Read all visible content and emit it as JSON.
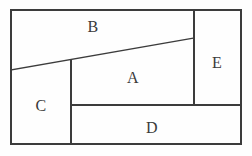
{
  "figure": {
    "type": "rectangle-dissection",
    "title": "",
    "background_color": "#fefefe",
    "line_color": "#3c3c3c",
    "label_color": "#3a3a3a",
    "canvas": {
      "width": 252,
      "height": 156
    },
    "outer_border": {
      "x1": 11,
      "y1": 10,
      "x2": 241,
      "y2": 144
    },
    "regions": [
      {
        "id": "A",
        "label": "A",
        "label_x": 133,
        "label_y": 78
      },
      {
        "id": "B",
        "label": "B",
        "label_x": 93,
        "label_y": 27
      },
      {
        "id": "C",
        "label": "C",
        "label_x": 41,
        "label_y": 106
      },
      {
        "id": "D",
        "label": "D",
        "label_x": 152,
        "label_y": 128
      },
      {
        "id": "E",
        "label": "E",
        "label_x": 217,
        "label_y": 63
      }
    ],
    "segments": [
      {
        "name": "outer-top",
        "x1": 11,
        "y1": 10,
        "x2": 241,
        "y2": 10
      },
      {
        "name": "outer-right",
        "x1": 241,
        "y1": 10,
        "x2": 241,
        "y2": 144
      },
      {
        "name": "outer-bottom",
        "x1": 241,
        "y1": 144,
        "x2": 11,
        "y2": 144
      },
      {
        "name": "outer-left",
        "x1": 11,
        "y1": 144,
        "x2": 11,
        "y2": 10
      },
      {
        "name": "diagonal-b-lower",
        "x1": 11,
        "y1": 70,
        "x2": 194,
        "y2": 38
      },
      {
        "name": "vertical-left",
        "x1": 71,
        "y1": 60,
        "x2": 71,
        "y2": 144
      },
      {
        "name": "vertical-right",
        "x1": 194,
        "y1": 10,
        "x2": 194,
        "y2": 105
      },
      {
        "name": "horizontal-mid",
        "x1": 71,
        "y1": 105,
        "x2": 241,
        "y2": 105
      }
    ]
  }
}
